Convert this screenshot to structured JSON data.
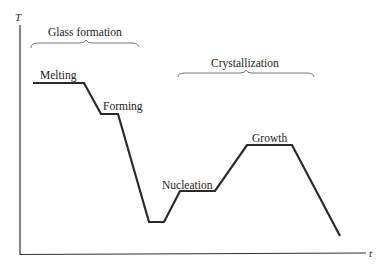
{
  "diagram": {
    "axes": {
      "y_label": "T",
      "x_label": "t"
    },
    "brackets": [
      {
        "label": "Glass formation"
      },
      {
        "label": "Crystallization"
      }
    ],
    "stages": [
      {
        "label": "Melting"
      },
      {
        "label": "Forming"
      },
      {
        "label": "Nucleation"
      },
      {
        "label": "Growth"
      }
    ],
    "line_color": "#2a2a2a"
  }
}
